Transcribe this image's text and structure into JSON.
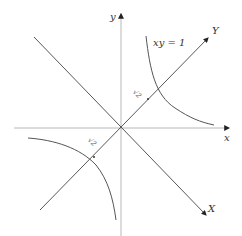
{
  "diagram": {
    "curve_label": "xy = 1",
    "axes": {
      "x_label": "x",
      "y_label": "y",
      "X_label": "X",
      "Y_label": "Y"
    },
    "distance_labels": [
      "√2",
      "√2"
    ],
    "colors": {
      "axis": "#b8b8b8",
      "rotated_axis": "#444444",
      "curve": "#555555",
      "text": "#333333"
    }
  }
}
